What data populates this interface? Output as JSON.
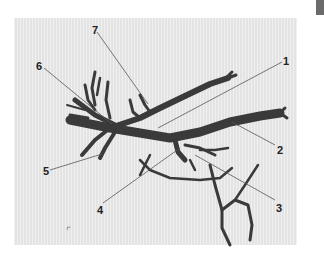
{
  "figure": {
    "colors": {
      "background": "#e8e8e8",
      "cast": "#3a3a3a",
      "leader": "#555555",
      "tab": "#6b6b6b"
    },
    "labels": [
      {
        "id": "1",
        "text": "1",
        "x": 283,
        "y": 56
      },
      {
        "id": "2",
        "text": "2",
        "x": 277,
        "y": 145
      },
      {
        "id": "3",
        "text": "3",
        "x": 276,
        "y": 203
      },
      {
        "id": "4",
        "text": "4",
        "x": 97,
        "y": 205
      },
      {
        "id": "5",
        "text": "5",
        "x": 43,
        "y": 166
      },
      {
        "id": "6",
        "text": "6",
        "x": 36,
        "y": 61
      },
      {
        "id": "7",
        "text": "7",
        "x": 92,
        "y": 25
      }
    ],
    "corner_mark": "⌜"
  }
}
